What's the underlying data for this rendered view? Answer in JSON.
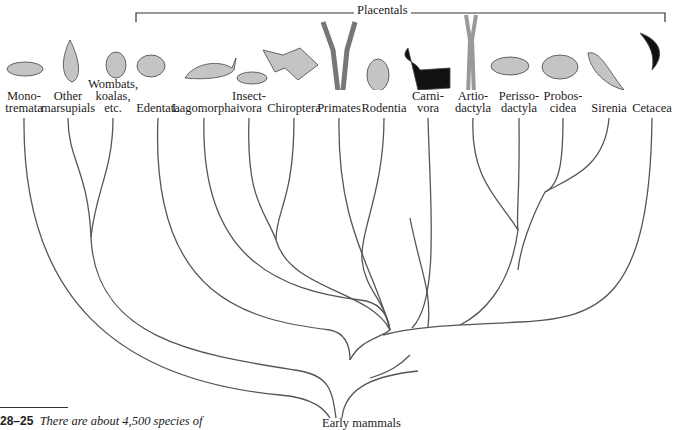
{
  "figure": {
    "group_label": "Placentals",
    "root_label": "Early mammals",
    "caption_number": "28–25",
    "caption_text": "There are about 4,500 species of"
  },
  "taxa": [
    {
      "line1": "",
      "line2": "Mono-",
      "line3": "tremata",
      "x": 24,
      "animal": "platypus"
    },
    {
      "line1": "",
      "line2": "Other",
      "line3": "marsupials",
      "x": 68,
      "animal": "opossum"
    },
    {
      "line1": "Wombats,",
      "line2": "koalas,",
      "line3": "etc.",
      "x": 113,
      "animal": "koala"
    },
    {
      "line1": "",
      "line2": "",
      "line3": "Edentata",
      "x": 158,
      "animal": "armadillo"
    },
    {
      "line1": "",
      "line2": "",
      "line3": "Lagomorpha",
      "x": 204,
      "animal": "rabbit"
    },
    {
      "line1": "",
      "line2": "Insect-",
      "line3": "ivora",
      "x": 249,
      "animal": "mole"
    },
    {
      "line1": "",
      "line2": "",
      "line3": "Chiroptera",
      "x": 294,
      "animal": "bat"
    },
    {
      "line1": "",
      "line2": "",
      "line3": "Primates",
      "x": 339,
      "animal": "gibbon"
    },
    {
      "line1": "",
      "line2": "",
      "line3": "Rodentia",
      "x": 384,
      "animal": "beaver"
    },
    {
      "line1": "",
      "line2": "Carni-",
      "line3": "vora",
      "x": 428,
      "animal": "skunk"
    },
    {
      "line1": "",
      "line2": "Artio-",
      "line3": "dactyla",
      "x": 473,
      "animal": "antelope"
    },
    {
      "line1": "",
      "line2": "Perisso-",
      "line3": "dactyla",
      "x": 519,
      "animal": "rhinoceros"
    },
    {
      "line1": "",
      "line2": "Probos-",
      "line3": "cidea",
      "x": 563,
      "animal": "elephant"
    },
    {
      "line1": "",
      "line2": "",
      "line3": "Sirenia",
      "x": 609,
      "animal": "manatee"
    },
    {
      "line1": "",
      "line2": "",
      "line3": "Cetacea",
      "x": 652,
      "animal": "dolphin"
    }
  ],
  "colors": {
    "line": "#555555",
    "text": "#222222",
    "animal": "#bdbdbd",
    "animal_dark": "#111111"
  }
}
